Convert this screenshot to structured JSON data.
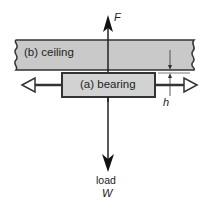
{
  "diagram": {
    "ceiling": {
      "label": "(b) ceiling",
      "fill": "#c9c9c9",
      "stroke": "#333333"
    },
    "bearing": {
      "label": "(a) bearing",
      "fill": "#d2d2d2",
      "stroke": "#333333"
    },
    "force_up": {
      "label": "F"
    },
    "load_down": {
      "label_line1": "load",
      "label_line2": "W"
    },
    "gap": {
      "label": "h"
    },
    "horizontal_arrow": {
      "direction": "both",
      "head_style": "open-triangle"
    }
  }
}
